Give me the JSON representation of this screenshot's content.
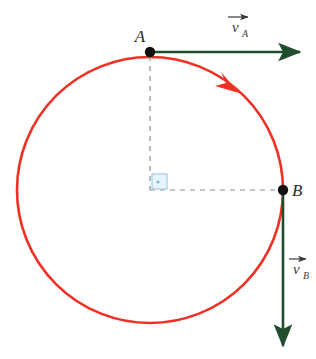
{
  "figure": {
    "background_color": "#ffffff",
    "width": 316,
    "height": 359
  },
  "colors": {
    "circle": "#ee3124",
    "direction_arrow": "#ee3124",
    "vector": "#1f4d2e",
    "point": "#111111",
    "dashed_guide": "#8f8f8f",
    "right_angle_marker_stroke": "#a8cfe8",
    "right_angle_marker_fill": "#e8f3fb",
    "label_text": "#2b2b2b"
  },
  "circle": {
    "name": "trajectory-circle",
    "center_x": 150,
    "center_y": 190,
    "radius": 133,
    "stroke_width": 2.6
  },
  "points": [
    {
      "id": "A",
      "label": "A",
      "x": 150,
      "y": 52,
      "label_x": 140,
      "label_y": 42,
      "radius": 5.2
    },
    {
      "id": "B",
      "label": "B",
      "x": 283,
      "y": 190,
      "label_x": 292,
      "label_y": 196,
      "radius": 5.2
    }
  ],
  "vectors": [
    {
      "id": "vA",
      "symbol": "v",
      "subscript": "A",
      "origin_x": 150,
      "origin_y": 52,
      "tip_x": 306,
      "tip_y": 52,
      "direction": "right",
      "label_x": 232,
      "label_y": 32,
      "arrow_bar_x1": 228,
      "arrow_bar_x2": 252,
      "arrow_bar_y": 17
    },
    {
      "id": "vB",
      "symbol": "v",
      "subscript": "B",
      "origin_x": 283,
      "origin_y": 190,
      "tip_x": 283,
      "tip_y": 352,
      "direction": "down",
      "label_x": 293,
      "label_y": 274,
      "arrow_bar_x1": 289,
      "arrow_bar_x2": 310,
      "arrow_bar_y": 259
    }
  ],
  "guides": [
    {
      "id": "radius-vertical",
      "x1": 150,
      "y1": 56,
      "x2": 150,
      "y2": 190,
      "style": "dashed"
    },
    {
      "id": "radius-horizontal",
      "x1": 150,
      "y1": 190,
      "x2": 280,
      "y2": 190,
      "style": "dashed"
    }
  ],
  "right_angle_marker": {
    "id": "right-angle-marker",
    "x": 152,
    "y": 174,
    "size": 15,
    "dot_x": 158,
    "dot_y": 182
  },
  "direction_indicator": {
    "id": "clockwise-direction-arrow",
    "description": "clockwise motion arrow on circle arc",
    "tip_x": 237,
    "tip_y": 91,
    "angle_deg": 52
  }
}
